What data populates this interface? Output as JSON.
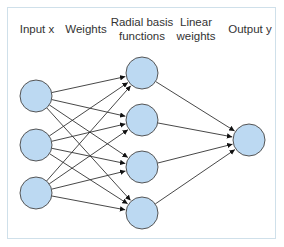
{
  "diagram": {
    "columns": [
      {
        "id": "input",
        "label": "Input x",
        "x": 37
      },
      {
        "id": "weights",
        "label": "Weights",
        "x": 90
      },
      {
        "id": "rbf",
        "label": "Radial basis\nfunctions",
        "x": 142
      },
      {
        "id": "linear",
        "label": "Linear\nweights",
        "x": 196
      },
      {
        "id": "output",
        "label": "Output y",
        "x": 251
      }
    ],
    "nodes": {
      "input": [
        {
          "id": "x1",
          "cx": 36,
          "cy": 96
        },
        {
          "id": "x2",
          "cx": 36,
          "cy": 145
        },
        {
          "id": "x3",
          "cx": 36,
          "cy": 193
        }
      ],
      "rbf": [
        {
          "id": "h1",
          "cx": 142,
          "cy": 73
        },
        {
          "id": "h2",
          "cx": 142,
          "cy": 120
        },
        {
          "id": "h3",
          "cx": 142,
          "cy": 167
        },
        {
          "id": "h4",
          "cx": 142,
          "cy": 213
        }
      ],
      "output": [
        {
          "id": "y",
          "cx": 249,
          "cy": 140
        }
      ]
    },
    "node_radius": 16,
    "connections": "fully connected input→rbf, rbf→output",
    "colors": {
      "node_fill": "#bcd9f2",
      "node_stroke": "#555555",
      "edge": "#333333",
      "frame": "#cfe0ea",
      "text": "#333333"
    }
  }
}
